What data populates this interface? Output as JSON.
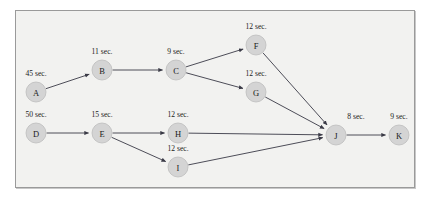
{
  "diagram": {
    "frame": {
      "border_color": "#9a9a9a",
      "background": "#f2f2f0"
    },
    "node_style": {
      "fill": "#d4d4d4",
      "stroke": "#bdbdbd",
      "radius": 10
    },
    "edge_style": {
      "color": "#3a3a46",
      "arrowhead": "filled-triangle"
    },
    "nodes": [
      {
        "id": "A",
        "label": "A",
        "duration": "45 sec.",
        "cx": 36,
        "cy": 92,
        "label_x": 36,
        "label_y": 76
      },
      {
        "id": "B",
        "label": "B",
        "duration": "11 sec.",
        "cx": 102,
        "cy": 70,
        "label_x": 102,
        "label_y": 54
      },
      {
        "id": "C",
        "label": "C",
        "duration": "9 sec.",
        "cx": 176,
        "cy": 70,
        "label_x": 176,
        "label_y": 54
      },
      {
        "id": "D",
        "label": "D",
        "duration": "50 sec.",
        "cx": 36,
        "cy": 133,
        "label_x": 36,
        "label_y": 117
      },
      {
        "id": "E",
        "label": "E",
        "duration": "15 sec.",
        "cx": 102,
        "cy": 133,
        "label_x": 102,
        "label_y": 117
      },
      {
        "id": "F",
        "label": "F",
        "duration": "12 sec.",
        "cx": 256,
        "cy": 45,
        "label_x": 256,
        "label_y": 29
      },
      {
        "id": "G",
        "label": "G",
        "duration": "12 sec.",
        "cx": 256,
        "cy": 92,
        "label_x": 256,
        "label_y": 76
      },
      {
        "id": "H",
        "label": "H",
        "duration": "12 sec.",
        "cx": 178,
        "cy": 133,
        "label_x": 178,
        "label_y": 117
      },
      {
        "id": "I",
        "label": "I",
        "duration": "12 sec.",
        "cx": 178,
        "cy": 167,
        "label_x": 178,
        "label_y": 151
      },
      {
        "id": "J",
        "label": "J",
        "duration": "8 sec.",
        "cx": 336,
        "cy": 135,
        "label_x": 356,
        "label_y": 119
      },
      {
        "id": "K",
        "label": "K",
        "duration": "9 sec.",
        "cx": 399,
        "cy": 135,
        "label_x": 399,
        "label_y": 119
      }
    ],
    "edges": [
      {
        "from": "A",
        "to": "B"
      },
      {
        "from": "B",
        "to": "C"
      },
      {
        "from": "C",
        "to": "F"
      },
      {
        "from": "C",
        "to": "G"
      },
      {
        "from": "D",
        "to": "E"
      },
      {
        "from": "E",
        "to": "H"
      },
      {
        "from": "E",
        "to": "I"
      },
      {
        "from": "F",
        "to": "J"
      },
      {
        "from": "G",
        "to": "J"
      },
      {
        "from": "H",
        "to": "J"
      },
      {
        "from": "I",
        "to": "J"
      },
      {
        "from": "J",
        "to": "K"
      }
    ]
  }
}
